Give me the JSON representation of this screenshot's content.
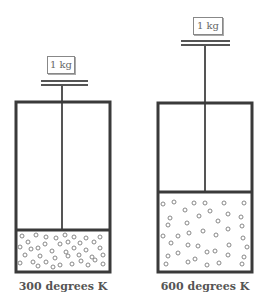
{
  "colors": {
    "stroke": "#3a3a3a",
    "rod": "#555555",
    "particle": "#888888"
  },
  "cylinders": [
    {
      "weight_label": "1 kg",
      "temperature_label": "300 degrees K",
      "gas_fraction": 0.25
    },
    {
      "weight_label": "1 kg",
      "temperature_label": "600 degrees K",
      "gas_fraction": 0.5
    }
  ]
}
